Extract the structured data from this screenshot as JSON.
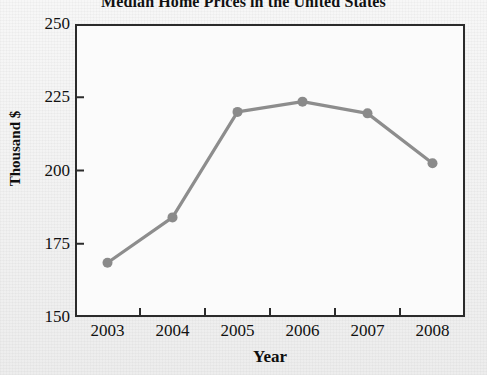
{
  "chart_data": {
    "type": "line",
    "title": "Median Home Prices in the United States",
    "xlabel": "Year",
    "ylabel": "Thousand $",
    "categories": [
      "2003",
      "2004",
      "2005",
      "2006",
      "2007",
      "2008"
    ],
    "x": [
      2003,
      2004,
      2005,
      2006,
      2007,
      2008
    ],
    "values": [
      168.5,
      184,
      220,
      223.5,
      219.5,
      202.5
    ],
    "series": [
      {
        "name": "Median Home Price",
        "values": [
          168.5,
          184,
          220,
          223.5,
          219.5,
          202.5
        ]
      }
    ],
    "ylim": [
      150,
      250
    ],
    "yticks": [
      150,
      175,
      200,
      225,
      250
    ],
    "ytick_labels": [
      "150",
      "175",
      "200",
      "225",
      "250"
    ],
    "xticks": [
      2003,
      2004,
      2005,
      2006,
      2007,
      2008
    ],
    "xtick_labels": [
      "2003",
      "2004",
      "2005",
      "2006",
      "2007",
      "2008"
    ],
    "grid": false,
    "legend": "none",
    "marker": "circle",
    "line_color": "#8d8d8d",
    "marker_color": "#8a8a8a",
    "axis_color": "#2b2b2b",
    "plot_background": "#fbfbfb",
    "figure_background": "#f3f3f3",
    "text_color": "#111111",
    "tick_direction": "in"
  }
}
